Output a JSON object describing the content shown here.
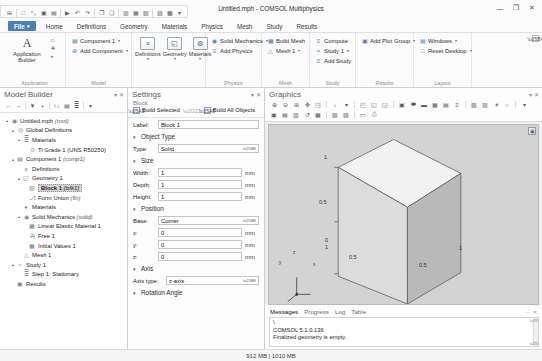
{
  "window": {
    "title": "Untitled.mph - COMSOL Multiphysics",
    "minimize": "—",
    "maximize": "❐",
    "close": "✕"
  },
  "quick_access": {
    "items": [
      {
        "name": "app-menu-icon",
        "glyph": "⊞"
      },
      {
        "name": "new-icon",
        "glyph": "□"
      },
      {
        "name": "open-icon",
        "glyph": "⤡"
      },
      {
        "name": "save-icon",
        "glyph": "▣"
      },
      {
        "name": "save-as-icon",
        "glyph": "▤"
      },
      {
        "name": "run-icon",
        "glyph": "▶"
      },
      {
        "name": "undo-icon",
        "glyph": "↶"
      },
      {
        "name": "redo-icon",
        "glyph": "↷"
      },
      {
        "name": "copy-icon",
        "glyph": "❐"
      },
      {
        "name": "paste-icon",
        "glyph": "❑"
      },
      {
        "name": "build-icon",
        "glyph": "▥"
      },
      {
        "name": "mesh-icon",
        "glyph": "▦"
      },
      {
        "name": "compute-icon",
        "glyph": "▧"
      },
      {
        "name": "plot-icon",
        "glyph": "▨"
      },
      {
        "name": "help-icon",
        "glyph": "▩"
      },
      {
        "name": "customize-caret",
        "glyph": "▾"
      }
    ]
  },
  "ribbon": {
    "tabs": [
      {
        "label": "File",
        "active": true
      },
      {
        "label": "Home"
      },
      {
        "label": "Definitions"
      },
      {
        "label": "Geometry"
      },
      {
        "label": "Materials"
      },
      {
        "label": "Physics"
      },
      {
        "label": "Mesh"
      },
      {
        "label": "Study"
      },
      {
        "label": "Results"
      }
    ],
    "groups": [
      {
        "label": "Application",
        "big_button": {
          "label": "Application Builder",
          "glyph": "A"
        },
        "side_icons": [
          "□",
          "✚",
          "▸"
        ]
      },
      {
        "label": "Model",
        "items": [
          {
            "label": "Component 1",
            "icon": "▤",
            "dropdown": true
          },
          {
            "label": "Add Component",
            "icon": "⊕",
            "dropdown": true
          }
        ]
      },
      {
        "label": "",
        "icon_buttons": [
          {
            "label": "Definitions",
            "glyph": "≡"
          },
          {
            "label": "Geometry",
            "glyph": "◱"
          },
          {
            "label": "Materials",
            "glyph": "⚙"
          }
        ]
      },
      {
        "label": "Physics",
        "items": [
          {
            "label": "Solid Mechanics",
            "icon": "◉",
            "dropdown": true
          },
          {
            "label": "Add Physics",
            "icon": "≡",
            "dropdown": false
          }
        ]
      },
      {
        "label": "Mesh",
        "items": [
          {
            "label": "Build Mesh",
            "icon": "▦",
            "dropdown": false
          },
          {
            "label": "Mesh 1",
            "icon": "△",
            "dropdown": true
          }
        ]
      },
      {
        "label": "Study",
        "items": [
          {
            "label": "Compute",
            "icon": "≡",
            "dropdown": false
          },
          {
            "label": "Study 1",
            "icon": "≈",
            "dropdown": true
          },
          {
            "label": "Add Study",
            "icon": "≡",
            "dropdown": false
          }
        ]
      },
      {
        "label": "Results",
        "items": [
          {
            "label": "Add Plot Group",
            "icon": "▣",
            "dropdown": true
          }
        ]
      },
      {
        "label": "Layout",
        "items": [
          {
            "label": "Windows",
            "icon": "▤",
            "dropdown": true
          },
          {
            "label": "Reset Desktop",
            "icon": "□",
            "dropdown": true
          }
        ]
      }
    ]
  },
  "model_builder": {
    "title": "Model Builder",
    "toolbar": [
      "←",
      "→",
      "▼",
      "•",
      "↑↓",
      "▤",
      "≣",
      "▾"
    ],
    "collapse": "▾",
    "close": "✕",
    "tree": [
      {
        "depth": 0,
        "arrow": "▴",
        "icon": "◉",
        "color": "#5a7fa8",
        "text": "Untitled.mph",
        "note": "(root)"
      },
      {
        "depth": 1,
        "arrow": "▴",
        "icon": "◎",
        "color": "#6d6d6d",
        "text": "Global Definitions",
        "note": ""
      },
      {
        "depth": 2,
        "arrow": "▴",
        "icon": "≣",
        "color": "#8a8a8a",
        "text": "Materials",
        "note": ""
      },
      {
        "depth": 3,
        "arrow": "",
        "icon": "⊙",
        "color": "#8a8a8a",
        "text": "Ti Grade 1 (UNS R50250)",
        "note": ""
      },
      {
        "depth": 1,
        "arrow": "▴",
        "icon": "▤",
        "color": "#5a7fa8",
        "text": "Component 1",
        "note": "(comp1)"
      },
      {
        "depth": 2,
        "arrow": "",
        "icon": "≡",
        "color": "#8a8a8a",
        "text": "Definitions",
        "note": ""
      },
      {
        "depth": 2,
        "arrow": "▴",
        "icon": "◱",
        "color": "#7f7f7f",
        "text": "Geometry 1",
        "note": ""
      },
      {
        "depth": 3,
        "arrow": "",
        "icon": "▧",
        "color": "#6f8eb0",
        "text": "Block 1",
        "note": "(blk1)",
        "selected": true
      },
      {
        "depth": 3,
        "arrow": "",
        "icon": "⎇",
        "color": "#8a8a8a",
        "text": "Form Union",
        "note": "(fin)"
      },
      {
        "depth": 2,
        "arrow": "",
        "icon": "●",
        "color": "#8a8a8a",
        "text": "Materials",
        "note": ""
      },
      {
        "depth": 2,
        "arrow": "▴",
        "icon": "◉",
        "color": "#6f8eb0",
        "text": "Solid Mechanics",
        "note": "(solid)"
      },
      {
        "depth": 3,
        "arrow": "",
        "icon": "▦",
        "color": "#5a7fa8",
        "text": "Linear Elastic Material 1",
        "note": ""
      },
      {
        "depth": 3,
        "arrow": "",
        "icon": "✇",
        "color": "#6d6d6d",
        "text": "Free 1",
        "note": ""
      },
      {
        "depth": 3,
        "arrow": "",
        "icon": "▦",
        "color": "#5a7fa8",
        "text": "Initial Values 1",
        "note": ""
      },
      {
        "depth": 2,
        "arrow": "",
        "icon": "△",
        "color": "#7f7f7f",
        "text": "Mesh 1",
        "note": ""
      },
      {
        "depth": 1,
        "arrow": "▴",
        "icon": "≈",
        "color": "#7f7f7f",
        "text": "Study 1",
        "note": ""
      },
      {
        "depth": 2,
        "arrow": "",
        "icon": "≣",
        "color": "#8a8a8a",
        "text": "Step 1: Stationary",
        "note": ""
      },
      {
        "depth": 1,
        "arrow": "",
        "icon": "▣",
        "color": "#7f7f7f",
        "text": "Results",
        "note": ""
      }
    ]
  },
  "settings": {
    "title": "Settings",
    "collapse": "▾",
    "close": "✕",
    "subtitle": "Block",
    "build_selected": "Build Selected",
    "build_all": "Build All Objects",
    "label_caption": "Label:",
    "label_value": "Block 1",
    "sections": {
      "object_type": {
        "title": "Object Type",
        "twisty": "▾",
        "type_caption": "Type:",
        "type_value": "Solid"
      },
      "size": {
        "title": "Size",
        "twisty": "▾",
        "fields": [
          {
            "label": "Width:",
            "value": "1",
            "unit": "mm"
          },
          {
            "label": "Depth:",
            "value": "1",
            "unit": "mm"
          },
          {
            "label": "Height:",
            "value": "1",
            "unit": "mm"
          }
        ]
      },
      "position": {
        "title": "Position",
        "twisty": "▾",
        "base_caption": "Base:",
        "base_value": "Corner",
        "fields": [
          {
            "label": "x:",
            "value": "0",
            "unit": "mm"
          },
          {
            "label": "y:",
            "value": "0",
            "unit": "mm"
          },
          {
            "label": "z:",
            "value": "0",
            "unit": "mm"
          }
        ]
      },
      "axis": {
        "title": "Axis",
        "twisty": "▾",
        "axis_type_caption": "Axis type:",
        "axis_type_value": "z-axis"
      },
      "rotation_angle": {
        "title": "Rotation Angle",
        "twisty": "▾"
      }
    }
  },
  "graphics": {
    "title": "Graphics",
    "collapse": "▾",
    "close": "✕",
    "toolbar_row1": [
      {
        "name": "zoom-in-icon",
        "glyph": "⊕"
      },
      {
        "name": "zoom-out-icon",
        "glyph": "⊖"
      },
      {
        "name": "zoom-box-icon",
        "glyph": "⊞"
      },
      {
        "name": "zoom-extents-icon",
        "glyph": "✥"
      },
      {
        "name": "zoom-selection-icon",
        "glyph": "◳"
      },
      {
        "name": "go-to-default-view-icon",
        "glyph": "↓"
      },
      {
        "name": "view-dropdown-caret",
        "glyph": "▾"
      },
      {
        "name": "view-xy-icon",
        "glyph": "◰"
      },
      {
        "name": "view-yz-icon",
        "glyph": "◱"
      },
      {
        "name": "view-zx-icon",
        "glyph": "◲"
      },
      {
        "name": "select-box-icon",
        "glyph": "▣"
      },
      {
        "name": "select-circle-icon",
        "glyph": "⬬"
      },
      {
        "name": "select-rect-icon",
        "glyph": "▬"
      },
      {
        "name": "select-all-icon",
        "glyph": "▦"
      },
      {
        "name": "clear-selection-icon",
        "glyph": "▤"
      },
      {
        "name": "selection-list-icon",
        "glyph": "≡"
      },
      {
        "name": "transparency-icon",
        "glyph": "▧"
      },
      {
        "name": "wireframe-icon",
        "glyph": "▥"
      },
      {
        "name": "headlight-icon",
        "glyph": "☀"
      },
      {
        "name": "scene-light-icon",
        "glyph": "☼"
      },
      {
        "name": "more-tools-caret",
        "glyph": "▾"
      }
    ],
    "toolbar_row2": [
      {
        "name": "image-snapshot-icon",
        "glyph": "▣"
      },
      {
        "name": "copy-image-icon",
        "glyph": "▤"
      },
      {
        "name": "print-view-icon",
        "glyph": "▥"
      },
      {
        "name": "reset-view-icon",
        "glyph": "↺"
      },
      {
        "name": "orthographic-icon",
        "glyph": "▦"
      },
      {
        "name": "perspective-icon",
        "glyph": "▧"
      },
      {
        "name": "axis-toggle-icon",
        "glyph": "▨"
      },
      {
        "name": "scene-camera-icon",
        "glyph": "▭"
      },
      {
        "name": "print-icon",
        "glyph": "⎙"
      }
    ],
    "canvas_badge": "▣",
    "axis_labels": {
      "x": "x",
      "y": "y",
      "z": "z"
    },
    "tick_labels": {
      "z_top": "1",
      "z_mid": "0.5",
      "z_zero_a": "0",
      "z_zero_b": "1",
      "y_mid": "0.5",
      "x_mid": "0.5",
      "x_right": "1"
    },
    "origin_label": "cm"
  },
  "messages": {
    "tabs": [
      {
        "label": "Messages",
        "active": true
      },
      {
        "label": "Progress",
        "active": false
      },
      {
        "label": "Log",
        "active": false
      },
      {
        "label": "Table",
        "active": false
      }
    ],
    "controls": "− ✕",
    "lines": [
      "\\",
      "COMSOL 5.1.0.136",
      "Finalized geometry is empty."
    ]
  },
  "status": {
    "memory": "912 MB | 1010 MB"
  }
}
